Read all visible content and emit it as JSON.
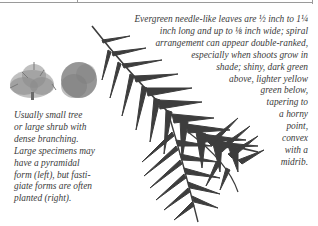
{
  "description": {
    "leaves_lines": [
      "Evergreen needle-like leaves are ½ inch to 1¼",
      "inch long and up to ⅛ inch wide; spiral",
      "arrangement can appear double-ranked,",
      "especially when shoots grow in",
      "shade; shiny, dark green",
      "above, lighter yellow",
      "green below,",
      "tapering to",
      "a horny",
      "point,",
      "convex",
      "with a",
      "midrib."
    ],
    "form_lines": [
      "Usually small tree",
      "or large shrub with",
      "dense branching.",
      "Large specimens may",
      "have a pyramidal",
      "form (left), but fasti-",
      "giate forms are often",
      "planted (right)."
    ]
  },
  "illustrations": {
    "shrub_left": "pyramidal-form-shrub",
    "shrub_right": "fastigiate-form-shrub",
    "branch": "evergreen-yew-branch"
  },
  "colors": {
    "text": "#3a3a3a",
    "foliage": "#3c3c3c",
    "shrub": "#8a8a8a"
  }
}
